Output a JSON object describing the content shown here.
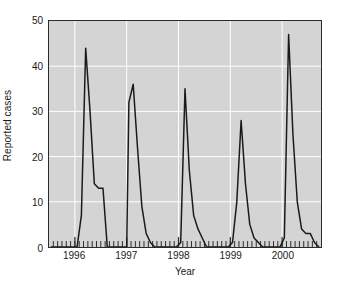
{
  "chart_data": {
    "type": "line",
    "title": "",
    "subtitle": "",
    "xlabel": "Year",
    "ylabel": "Reported cases",
    "xlim": [
      1995.5,
      2000.75
    ],
    "ylim": [
      0,
      50
    ],
    "yticks": [
      0,
      10,
      20,
      30,
      40,
      50
    ],
    "xticks": [
      1996,
      1997,
      1998,
      1999,
      2000
    ],
    "xtick_labels": [
      "1996",
      "1997",
      "1998",
      "1999",
      "2000"
    ],
    "ytick_labels": [
      "0",
      "10",
      "20",
      "30",
      "40",
      "50"
    ],
    "grid": true,
    "grid_color": "#ffffff",
    "plot_background": "#d4d4d4",
    "line_color": "#1a1a1a",
    "legend": null,
    "minor_tick_interval_months": 1,
    "annotations": [],
    "series": [
      {
        "name": "Reported cases",
        "x": [
          1995.542,
          1995.625,
          1995.708,
          1995.792,
          1995.875,
          1995.958,
          1996.042,
          1996.125,
          1996.208,
          1996.292,
          1996.375,
          1996.458,
          1996.542,
          1996.625,
          1996.708,
          1996.792,
          1996.875,
          1996.958,
          1997.0,
          1997.042,
          1997.125,
          1997.208,
          1997.292,
          1997.375,
          1997.458,
          1997.542,
          1997.625,
          1997.708,
          1997.792,
          1997.875,
          1997.958,
          1998.042,
          1998.125,
          1998.208,
          1998.292,
          1998.375,
          1998.458,
          1998.542,
          1998.625,
          1998.708,
          1998.792,
          1998.875,
          1998.958,
          1999.042,
          1999.125,
          1999.208,
          1999.292,
          1999.375,
          1999.458,
          1999.542,
          1999.625,
          1999.708,
          1999.792,
          1999.875,
          1999.958,
          2000.042,
          2000.125,
          2000.208,
          2000.292,
          2000.375,
          2000.458,
          2000.542,
          2000.625,
          2000.708
        ],
        "y": [
          0,
          0,
          0,
          0,
          0,
          0,
          0,
          7,
          44,
          30,
          14,
          13,
          13,
          0,
          0,
          0,
          0,
          0,
          0,
          32,
          36,
          22,
          9,
          3,
          1,
          0,
          0,
          0,
          0,
          0,
          0,
          1,
          35,
          17,
          7,
          4,
          2,
          0,
          0,
          0,
          0,
          0,
          0,
          1,
          10,
          28,
          14,
          5,
          2,
          1,
          0,
          0,
          0,
          0,
          0,
          2,
          47,
          25,
          10,
          4,
          3,
          3,
          1,
          0
        ]
      }
    ]
  },
  "axes": {
    "ylabel_text": "Reported cases",
    "xlabel_text": "Year"
  }
}
